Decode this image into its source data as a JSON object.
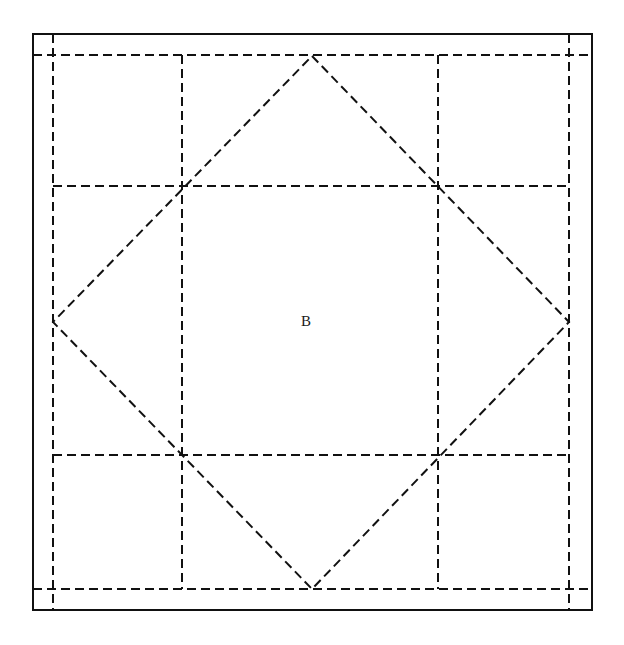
{
  "figure": {
    "canvas": {
      "width": 624,
      "height": 645,
      "background": "#ffffff"
    },
    "colors": {
      "stroke": "#111111",
      "dashed_stroke": "#111111",
      "label": "#1a1a1a",
      "background": "#ffffff"
    },
    "stroke_widths": {
      "solid_border": 2,
      "dashed": 2
    },
    "dash_pattern": "9 5"
  },
  "outer_square": {
    "name": "solid-outer-square",
    "left": 33,
    "top": 34,
    "right": 592,
    "bottom": 610,
    "width": 559,
    "height": 576
  },
  "grid": {
    "vertical_x": [
      53,
      182,
      438,
      569
    ],
    "horizontal_y": [
      55,
      186,
      455,
      589
    ],
    "extent": {
      "x_min": 53,
      "x_max": 569,
      "y_min": 55,
      "y_max": 589
    }
  },
  "diamond": {
    "name": "inscribed-diamond",
    "vertices": [
      {
        "id": "top",
        "x": 312,
        "y": 56
      },
      {
        "id": "right",
        "x": 569,
        "y": 322
      },
      {
        "id": "bottom",
        "x": 312,
        "y": 589
      },
      {
        "id": "left",
        "x": 53,
        "y": 322
      }
    ],
    "points_attr": "312,56 569,322 312,589 53,322"
  },
  "labels": [
    {
      "id": "B",
      "text": "B",
      "x": 306,
      "y": 321
    }
  ],
  "intersections": [
    {
      "x": 182,
      "y": 186
    },
    {
      "x": 438,
      "y": 186
    },
    {
      "x": 182,
      "y": 455
    },
    {
      "x": 438,
      "y": 455
    }
  ]
}
